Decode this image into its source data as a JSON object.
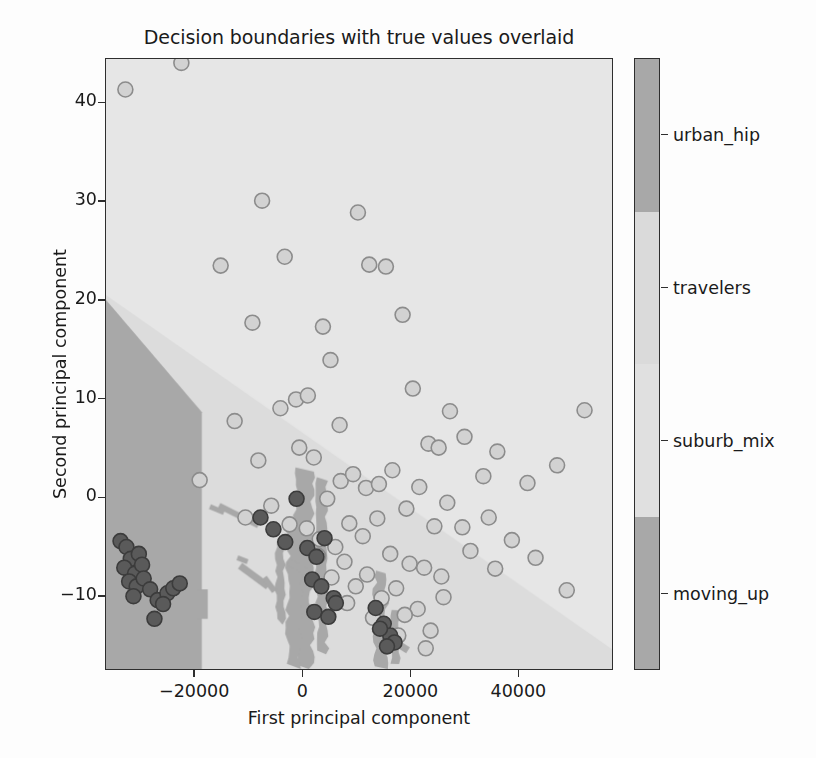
{
  "chart_data": {
    "type": "scatter",
    "title": "Decision boundaries with true values overlaid",
    "xlabel": "First principal component",
    "ylabel": "Second principal component",
    "xlim": [
      -36500,
      57500
    ],
    "ylim": [
      -17.5,
      44.5
    ],
    "xticks": [
      -20000,
      0,
      20000,
      40000
    ],
    "xtick_labels": [
      "−20000",
      "0",
      "20000",
      "40000"
    ],
    "yticks": [
      40,
      30,
      20,
      10,
      0,
      -10
    ],
    "ytick_labels": [
      "40",
      "30",
      "20",
      "10",
      "0",
      "−10"
    ],
    "grid": false,
    "legend_position": "right-colorbar",
    "colorbar": {
      "labels": [
        "urban_hip",
        "travelers",
        "suburb_mix",
        "moving_up"
      ],
      "colors": [
        "#a8a8a8",
        "#e0e0e0",
        "#dadada",
        "#a8a8a8"
      ],
      "tick_positions": [
        0.875,
        0.625,
        0.375,
        0.125
      ]
    },
    "region_colors": {
      "moving_up": "#a8a8a8",
      "suburb_mix": "#dcdcdc",
      "travelers": "#e6e6e6",
      "urban_hip": "#a8a8a8"
    },
    "marker": {
      "light_fill": "#d2d2d2",
      "light_edge": "#8c8c8c",
      "dark_fill": "#5a5a5a",
      "dark_edge": "#3c3c3c",
      "radius": 7.5
    },
    "series": [
      {
        "name": "light_points",
        "label": "true values (light class)",
        "x": [
          -32900,
          -22500,
          -15200,
          -7500,
          -9300,
          -3300,
          -1200,
          1000,
          3800,
          5200,
          6900,
          10300,
          12400,
          15500,
          18600,
          20500,
          23400,
          25300,
          27400,
          30100,
          33600,
          36200,
          41800,
          47300,
          52400,
          -19100,
          -12600,
          -8200,
          -4100,
          -600,
          2100,
          4600,
          7100,
          9400,
          11800,
          14200,
          16700,
          19300,
          21700,
          24500,
          26900,
          29700,
          34600,
          38900,
          43300,
          49100,
          -10600,
          -5800,
          -2400,
          800,
          3200,
          6100,
          8700,
          11200,
          13900,
          16300,
          19900,
          22600,
          25800,
          31200,
          35800,
          2900,
          7800,
          12000,
          17400,
          21400,
          26200,
          5400,
          9900,
          14700,
          19000,
          23800,
          8300,
          13100,
          17800,
          22900
        ],
        "y": [
          41.4,
          44.1,
          23.5,
          30.1,
          17.7,
          24.4,
          9.9,
          10.3,
          17.3,
          13.9,
          7.3,
          28.9,
          23.6,
          23.4,
          18.5,
          11.0,
          5.4,
          5.0,
          8.7,
          6.1,
          2.1,
          4.6,
          1.4,
          3.2,
          8.8,
          1.7,
          7.7,
          3.7,
          9.0,
          5.0,
          4.0,
          -0.2,
          1.6,
          2.3,
          0.9,
          1.3,
          2.7,
          -1.2,
          1.0,
          -3.0,
          -0.6,
          -3.1,
          -2.1,
          -4.4,
          -6.2,
          -9.5,
          -2.1,
          -0.9,
          -2.8,
          -3.2,
          -4.3,
          -5.1,
          -2.7,
          -4.0,
          -2.2,
          -5.8,
          -6.8,
          -7.2,
          -8.1,
          -5.5,
          -7.3,
          -6.0,
          -6.6,
          -7.9,
          -9.3,
          -11.4,
          -10.2,
          -8.2,
          -9.1,
          -10.3,
          -12.0,
          -13.6,
          -10.8,
          -12.3,
          -14.1,
          -15.4
        ]
      },
      {
        "name": "dark_points",
        "label": "true values (dark class)",
        "x": [
          -33800,
          -32700,
          -31900,
          -30400,
          -33100,
          -31100,
          -29800,
          -32200,
          -30800,
          -29500,
          -31400,
          -28300,
          -26900,
          -27500,
          -25100,
          -24000,
          -25900,
          -22800,
          -7800,
          -5400,
          -3200,
          -1100,
          900,
          2600,
          4100,
          1800,
          3500,
          5800,
          2200,
          4800,
          6200,
          13600,
          15100,
          16300,
          14400,
          17100,
          15700
        ],
        "y": [
          -4.5,
          -5.1,
          -6.3,
          -5.8,
          -7.2,
          -7.8,
          -6.9,
          -8.6,
          -9.1,
          -8.3,
          -10.1,
          -9.4,
          -10.5,
          -12.4,
          -9.8,
          -9.3,
          -10.9,
          -8.8,
          -2.1,
          -3.3,
          -4.6,
          -0.2,
          -5.2,
          -6.1,
          -4.2,
          -8.4,
          -9.1,
          -10.3,
          -11.7,
          -12.2,
          -10.8,
          -11.3,
          -12.9,
          -14.1,
          -13.4,
          -14.8,
          -15.2
        ]
      }
    ]
  },
  "figure": {
    "background_color": "#ffffff",
    "axes_edge_color": "#2e2e2e"
  }
}
